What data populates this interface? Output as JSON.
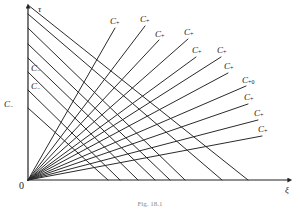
{
  "figure": {
    "caption": "Fig. 18.1",
    "axes": {
      "y_label": "τ",
      "x_label": "ξ",
      "origin_label": "0",
      "x_axis": {
        "x0": 28,
        "y0": 180,
        "x1": 292,
        "y1": 180
      },
      "y_axis": {
        "x0": 28,
        "y0": 180,
        "x1": 28,
        "y1": 5
      }
    }
  },
  "chart_data": {
    "type": "line",
    "title": "Fig. 18.1",
    "xlabel": "ξ",
    "ylabel": "τ",
    "grid": false,
    "legend": "none",
    "xlim": [
      0,
      292
    ],
    "ylim": [
      0,
      180
    ],
    "series": [
      {
        "name": "C+",
        "label": "C_{+}",
        "x": [
          28,
          115
        ],
        "y": [
          180,
          28
        ]
      },
      {
        "name": "C+",
        "label": "C_{+}",
        "x": [
          28,
          145
        ],
        "y": [
          180,
          26
        ]
      },
      {
        "name": "C+",
        "label": "C_{+}",
        "x": [
          28,
          159
        ],
        "y": [
          180,
          40
        ]
      },
      {
        "name": "C+",
        "label": "C_{+}",
        "x": [
          28,
          188
        ],
        "y": [
          180,
          39
        ]
      },
      {
        "name": "C+",
        "label": "C_{+}",
        "x": [
          28,
          196
        ],
        "y": [
          180,
          57
        ]
      },
      {
        "name": "C+",
        "label": "C_{+}",
        "x": [
          28,
          221
        ],
        "y": [
          180,
          57
        ]
      },
      {
        "name": "C+",
        "label": "C_{+}",
        "x": [
          28,
          228
        ],
        "y": [
          180,
          73
        ]
      },
      {
        "name": "C+0",
        "label": "C_{+0}",
        "x": [
          28,
          246
        ],
        "y": [
          180,
          86
        ]
      },
      {
        "name": "C+",
        "label": "C_{+}",
        "x": [
          28,
          248
        ],
        "y": [
          180,
          104
        ]
      },
      {
        "name": "C+",
        "label": "C_{+}",
        "x": [
          28,
          258
        ],
        "y": [
          180,
          120
        ]
      },
      {
        "name": "C+",
        "label": "C_{+}",
        "x": [
          28,
          262
        ],
        "y": [
          180,
          136
        ]
      },
      {
        "name": "C-",
        "label": "C_{-}",
        "x": [
          28,
          138
        ],
        "y": [
          72,
          180
        ]
      },
      {
        "name": "C-",
        "label": "C_{-}",
        "x": [
          28,
          120
        ],
        "y": [
          90,
          180
        ]
      },
      {
        "name": "C-",
        "label": "C_{-}",
        "x": [
          28,
          108
        ],
        "y": [
          108,
          180
        ]
      },
      {
        "name": "C-",
        "label": "",
        "x": [
          28,
          185
        ],
        "y": [
          28,
          180
        ]
      },
      {
        "name": "C-",
        "label": "",
        "x": [
          28,
          170
        ],
        "y": [
          44,
          180
        ]
      },
      {
        "name": "C-",
        "label": "",
        "x": [
          28,
          155
        ],
        "y": [
          58,
          180
        ]
      },
      {
        "name": "C-",
        "label": "",
        "x": [
          28,
          248
        ],
        "y": [
          5,
          180
        ]
      },
      {
        "name": "C-",
        "label": "",
        "x": [
          28,
          222
        ],
        "y": [
          14,
          180
        ]
      }
    ],
    "labels": [
      {
        "text": "C",
        "sub": "+",
        "x": 110,
        "y": 17
      },
      {
        "text": "C",
        "sub": "+",
        "x": 140,
        "y": 15
      },
      {
        "text": "C",
        "sub": "+",
        "x": 155,
        "y": 30
      },
      {
        "text": "C",
        "sub": "+",
        "x": 184,
        "y": 28
      },
      {
        "text": "C",
        "sub": "+",
        "x": 192,
        "y": 46
      },
      {
        "text": "C",
        "sub": "+",
        "x": 217,
        "y": 46
      },
      {
        "text": "C",
        "sub": "+",
        "x": 224,
        "y": 62
      },
      {
        "text": "C",
        "sub": "+0",
        "x": 242,
        "y": 76
      },
      {
        "text": "C",
        "sub": "+",
        "x": 244,
        "y": 93
      },
      {
        "text": "C",
        "sub": "+",
        "x": 254,
        "y": 109
      },
      {
        "text": "C",
        "sub": "+",
        "x": 258,
        "y": 125
      },
      {
        "text": "C",
        "sub": "−",
        "x": 31,
        "y": 64
      },
      {
        "text": "C",
        "sub": "−",
        "x": 31,
        "y": 82
      },
      {
        "text": "C",
        "sub": "−",
        "x": 4,
        "y": 100
      }
    ]
  }
}
